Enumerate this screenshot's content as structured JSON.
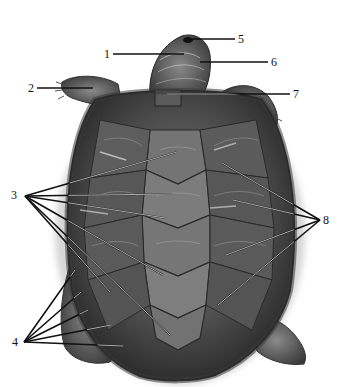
{
  "figure": {
    "labels": [
      {
        "id": "1",
        "text": "1",
        "x": 104,
        "y": 48
      },
      {
        "id": "2",
        "text": "2",
        "x": 28,
        "y": 82
      },
      {
        "id": "3",
        "text": "3",
        "x": 11,
        "y": 189
      },
      {
        "id": "4",
        "text": "4",
        "x": 12,
        "y": 336
      },
      {
        "id": "5",
        "text": "5",
        "x": 238,
        "y": 33
      },
      {
        "id": "6",
        "text": "6",
        "x": 271,
        "y": 56
      },
      {
        "id": "7",
        "text": "7",
        "x": 293,
        "y": 88
      },
      {
        "id": "8",
        "text": "8",
        "x": 323,
        "y": 214
      }
    ],
    "leader_lines": {
      "1": [
        [
          113,
          54,
          184,
          54
        ]
      ],
      "2": [
        [
          37,
          88,
          93,
          88
        ]
      ],
      "5": [
        [
          190,
          39,
          235,
          39
        ]
      ],
      "6": [
        [
          200,
          62,
          268,
          62
        ]
      ],
      "7": [
        [
          167,
          94,
          290,
          94
        ]
      ],
      "3": [
        [
          25,
          196,
          177,
          152
        ],
        [
          25,
          196,
          172,
          194
        ],
        [
          25,
          196,
          165,
          218
        ],
        [
          25,
          196,
          163,
          275
        ],
        [
          25,
          196,
          170,
          335
        ],
        [
          25,
          196,
          110,
          292
        ]
      ],
      "8": [
        [
          320,
          220,
          222,
          163
        ],
        [
          320,
          220,
          233,
          200
        ],
        [
          320,
          220,
          226,
          255
        ],
        [
          320,
          220,
          218,
          305
        ]
      ],
      "4": [
        [
          24,
          342,
          75,
          270
        ],
        [
          24,
          342,
          81,
          292
        ],
        [
          24,
          342,
          88,
          310
        ],
        [
          24,
          342,
          111,
          325
        ],
        [
          24,
          342,
          123,
          346
        ]
      ]
    },
    "colors": {
      "background": "#ffffff",
      "shell_dark": "#2a2a2a",
      "shell_mid": "#6b6b6b",
      "shell_light": "#9a9a9a",
      "line_dark": "#111111",
      "line_light": "#f2f2f2"
    }
  }
}
